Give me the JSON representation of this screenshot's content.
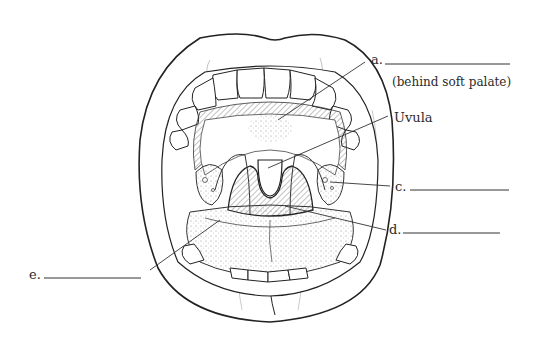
{
  "diagram": {
    "labels": {
      "a": {
        "letter": "a.",
        "note": "(behind soft palate)"
      },
      "uvula": {
        "text": "Uvula"
      },
      "c": {
        "letter": "c."
      },
      "d": {
        "letter": "d."
      },
      "e": {
        "letter": "e."
      }
    },
    "colors": {
      "line": "#222222",
      "hatch": "#555555",
      "background": "#ffffff"
    }
  }
}
